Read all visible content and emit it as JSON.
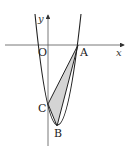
{
  "figure": {
    "axes": {
      "x_label": "x",
      "y_label": "y",
      "origin_label": "O"
    },
    "points": {
      "A": {
        "label": "A"
      },
      "B": {
        "label": "B"
      },
      "C": {
        "label": "C"
      }
    },
    "colors": {
      "stroke": "#222222",
      "axis": "#555555",
      "fill": "#d4d4d4"
    }
  }
}
